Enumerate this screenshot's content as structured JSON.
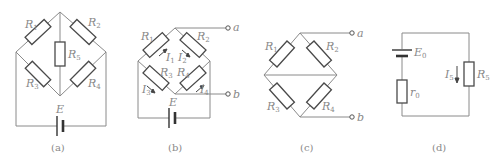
{
  "figures": [
    {
      "id": "a",
      "caption": "(a)",
      "resistors": [
        {
          "name": "R",
          "sub": "1"
        },
        {
          "name": "R",
          "sub": "2"
        },
        {
          "name": "R",
          "sub": "3"
        },
        {
          "name": "R",
          "sub": "4"
        },
        {
          "name": "R",
          "sub": "5"
        }
      ],
      "source": {
        "name": "E",
        "sub": ""
      }
    },
    {
      "id": "b",
      "caption": "(b)",
      "resistors": [
        {
          "name": "R",
          "sub": "1"
        },
        {
          "name": "R",
          "sub": "2"
        },
        {
          "name": "R",
          "sub": "3"
        },
        {
          "name": "R",
          "sub": "4"
        }
      ],
      "currents": [
        {
          "name": "I",
          "sub": "1"
        },
        {
          "name": "I",
          "sub": "2"
        },
        {
          "name": "I",
          "sub": "3"
        },
        {
          "name": "I",
          "sub": "4"
        }
      ],
      "terminals": [
        "a",
        "b"
      ],
      "source": {
        "name": "E",
        "sub": ""
      }
    },
    {
      "id": "c",
      "caption": "(c)",
      "resistors": [
        {
          "name": "R",
          "sub": "1"
        },
        {
          "name": "R",
          "sub": "2"
        },
        {
          "name": "R",
          "sub": "3"
        },
        {
          "name": "R",
          "sub": "4"
        }
      ],
      "terminals": [
        "a",
        "b"
      ]
    },
    {
      "id": "d",
      "caption": "(d)",
      "source": {
        "name": "E",
        "sub": "0"
      },
      "internal_resistance": {
        "name": "r",
        "sub": "0"
      },
      "load": {
        "name": "R",
        "sub": "5"
      },
      "current": {
        "name": "I",
        "sub": "5"
      }
    }
  ]
}
